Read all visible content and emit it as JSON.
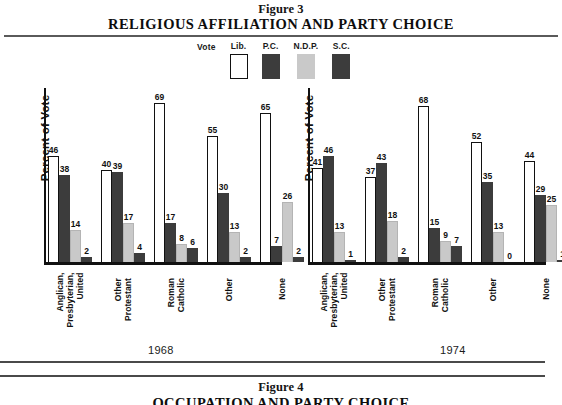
{
  "figure3": {
    "label": "Figure 3",
    "title": "RELIGIOUS AFFILIATION AND PARTY CHOICE"
  },
  "figure4": {
    "label": "Figure 4",
    "title": "OCCUPATION AND PARTY CHOICE"
  },
  "legend": {
    "vote_label": "Vote",
    "items": [
      {
        "label": "Lib.",
        "color": "#ffffff",
        "name": "liberal"
      },
      {
        "label": "P.C.",
        "color": "#3c3c3c",
        "name": "progressive-conservative"
      },
      {
        "label": "N.D.P.",
        "color": "#c9c9c9",
        "name": "new-democratic-party"
      },
      {
        "label": "S.C.",
        "color": "#3c3c3c",
        "name": "social-credit"
      }
    ]
  },
  "axis": {
    "y_label": "Percent of Vote"
  },
  "panels": [
    {
      "year": "1968"
    },
    {
      "year": "1974"
    }
  ],
  "chart_data": {
    "type": "bar",
    "title": "RELIGIOUS AFFILIATION AND PARTY CHOICE",
    "subtitle": "Figure 3",
    "xlabel": "",
    "ylabel": "Percent of Vote",
    "ylim": [
      0,
      70
    ],
    "grid": false,
    "legend_position": "top-center",
    "legend_title": "Vote",
    "panels": [
      {
        "year": "1968",
        "categories": [
          "Anglican, Presbyterian, United",
          "Other Protestant",
          "Roman Catholic",
          "Other",
          "None"
        ],
        "series": [
          {
            "name": "Lib.",
            "color": "#ffffff",
            "values": [
              46,
              40,
              69,
              55,
              65
            ]
          },
          {
            "name": "P.C.",
            "color": "#3c3c3c",
            "values": [
              38,
              39,
              17,
              30,
              7
            ]
          },
          {
            "name": "N.D.P.",
            "color": "#c9c9c9",
            "values": [
              14,
              17,
              8,
              13,
              26
            ]
          },
          {
            "name": "S.C.",
            "color": "#3c3c3c",
            "values": [
              2,
              4,
              6,
              2,
              2
            ]
          }
        ]
      },
      {
        "year": "1974",
        "categories": [
          "Anglican, Presbyterian, United",
          "Other Protestant",
          "Roman Catholic",
          "Other",
          "None"
        ],
        "series": [
          {
            "name": "Lib.",
            "color": "#ffffff",
            "values": [
              41,
              37,
              68,
              52,
              44
            ]
          },
          {
            "name": "P.C.",
            "color": "#3c3c3c",
            "values": [
              46,
              43,
              15,
              35,
              29
            ]
          },
          {
            "name": "N.D.P.",
            "color": "#c9c9c9",
            "values": [
              13,
              18,
              9,
              13,
              25
            ]
          },
          {
            "name": "S.C.",
            "color": "#3c3c3c",
            "values": [
              1,
              2,
              7,
              0,
              1
            ]
          }
        ]
      }
    ]
  },
  "category_lines": [
    [
      "Anglican,",
      "Presbyterian,",
      "United"
    ],
    [
      "Other",
      "Protestant"
    ],
    [
      "Roman",
      "Catholic"
    ],
    [
      "Other"
    ],
    [
      "None"
    ]
  ]
}
